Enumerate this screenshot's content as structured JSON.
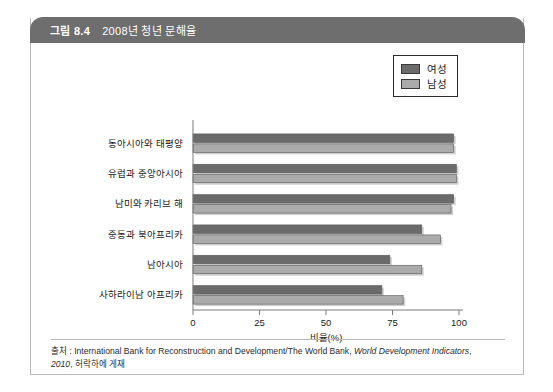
{
  "figure": {
    "number": "그림 8.4",
    "title": "2008년 청년 문해율"
  },
  "legend": {
    "items": [
      {
        "label": "여성",
        "color": "#6b6b6b"
      },
      {
        "label": "남성",
        "color": "#ababab"
      }
    ]
  },
  "source": {
    "prefix": "출처 : ",
    "line1_plain": "International Bank for Reconstruction and Development/The World Bank, ",
    "line1_italic": "World Development Indicators",
    "line1_tail": ",",
    "line2_italic": "2010",
    "line2_plain": ", 허락하에 게재"
  },
  "chart_data": {
    "type": "bar",
    "orientation": "horizontal",
    "title": "2008년 청년 문해율",
    "xlabel": "비율(%)",
    "ylabel": "",
    "xlim": [
      0,
      100
    ],
    "xticks": [
      0,
      25,
      50,
      75,
      100
    ],
    "xticklabels": [
      "0",
      "25",
      "50",
      "75",
      "100"
    ],
    "grid": false,
    "legend_position": "top-right",
    "categories": [
      "동아시아와 태평양",
      "유럽과 중앙아시아",
      "남미와 카리브 해",
      "중동과 북아프리카",
      "남아시아",
      "사하라이남 아프리카"
    ],
    "series": [
      {
        "name": "여성",
        "color": "#6b6b6b",
        "values": [
          98,
          99,
          98,
          86,
          74,
          71
        ]
      },
      {
        "name": "남성",
        "color": "#ababab",
        "values": [
          98,
          99,
          97,
          93,
          86,
          79
        ]
      }
    ]
  }
}
